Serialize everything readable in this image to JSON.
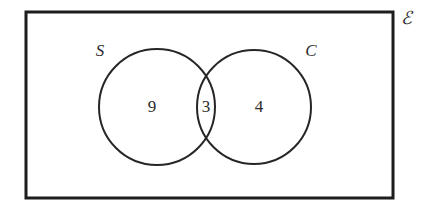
{
  "figure": {
    "type": "venn-diagram",
    "background_color": "#ffffff",
    "stroke_color": "#262626",
    "frame_color": "#1d1d1d"
  },
  "universe": {
    "label": "ℰ",
    "label_name": "universal-set-symbol",
    "frame": {
      "x": 26,
      "y": 12,
      "width": 367,
      "height": 186
    },
    "label_pos": {
      "x": 406,
      "y": 20
    }
  },
  "sets": [
    {
      "id": "S",
      "label": "S",
      "cx": 157,
      "cy": 107,
      "r": 58,
      "label_pos": {
        "x": 100,
        "y": 52
      }
    },
    {
      "id": "C",
      "label": "C",
      "cx": 254,
      "cy": 107,
      "r": 57,
      "label_pos": {
        "x": 311,
        "y": 52
      }
    }
  ],
  "regions": [
    {
      "id": "S-only",
      "label": "9",
      "x": 152,
      "y": 108
    },
    {
      "id": "S-and-C",
      "label": "3",
      "x": 206,
      "y": 108
    },
    {
      "id": "C-only",
      "label": "4",
      "x": 259,
      "y": 108
    }
  ],
  "chart_data": {
    "type": "venn",
    "title": "",
    "set_labels": [
      "S",
      "C"
    ],
    "universe_label": "ℰ",
    "region_labels": [
      "S only",
      "S ∩ C",
      "C only"
    ],
    "values": [
      9,
      3,
      4
    ],
    "total_in_sets": 16,
    "legend": "none",
    "grid": false
  }
}
